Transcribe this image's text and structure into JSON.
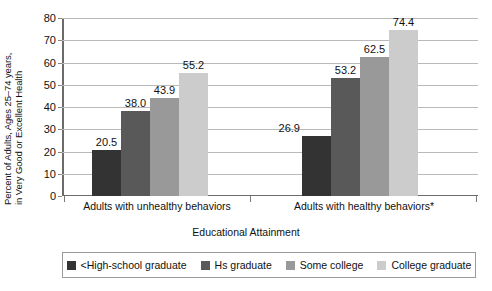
{
  "chart_data": {
    "type": "bar",
    "title": "",
    "xlabel": "Educational Attainment",
    "ylabel": "Percent of Adults, Ages 25–74 years, in Very Good or Excellent Health",
    "ylabel_line1": "Percent of Adults, Ages 25–74 years,",
    "ylabel_line2": "in Very Good or Excellent Health",
    "categories": [
      "Adults with unhealthy behaviors",
      "Adults with healthy behaviors*"
    ],
    "series": [
      {
        "name": "<High-school graduate",
        "color": "#333333",
        "values": [
          20.5,
          26.9
        ]
      },
      {
        "name": "Hs graduate",
        "color": "#595959",
        "values": [
          38.0,
          53.2
        ]
      },
      {
        "name": "Some college",
        "color": "#999999",
        "values": [
          43.9,
          62.5
        ]
      },
      {
        "name": "College graduate",
        "color": "#cccccc",
        "values": [
          55.2,
          74.4
        ]
      }
    ],
    "value_labels": [
      [
        "20.5",
        "38.0",
        "43.9",
        "55.2"
      ],
      [
        "26.9",
        "53.2",
        "62.5",
        "74.4"
      ]
    ],
    "ylim": [
      0,
      80
    ],
    "yticks": [
      0,
      10,
      20,
      30,
      40,
      50,
      60,
      70,
      80
    ],
    "ytick_labels": [
      "0",
      "10",
      "20",
      "30",
      "40",
      "50",
      "60",
      "70",
      "80"
    ],
    "grid": true,
    "legend_position": "bottom"
  }
}
